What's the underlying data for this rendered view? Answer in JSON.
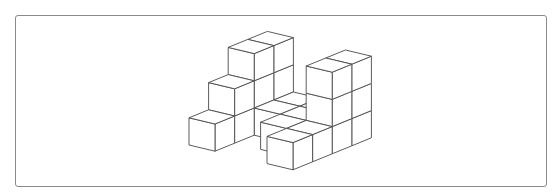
{
  "figure": {
    "cube_count": 24,
    "colors": {
      "edge": "#4a4a4a",
      "face": "#ffffff",
      "frame_border": "#8a8a8a"
    },
    "grid_axes": [
      "x (right)",
      "y (back)",
      "z (up)"
    ],
    "cubes": [
      [
        0,
        0,
        0
      ],
      [
        0,
        1,
        0
      ],
      [
        0,
        2,
        0
      ],
      [
        0,
        3,
        0
      ],
      [
        0,
        1,
        1
      ],
      [
        0,
        2,
        1
      ],
      [
        0,
        3,
        1
      ],
      [
        0,
        2,
        2
      ],
      [
        0,
        3,
        2
      ],
      [
        1,
        2,
        0
      ],
      [
        1,
        3,
        0
      ],
      [
        2,
        1,
        0
      ],
      [
        2,
        2,
        0
      ],
      [
        2,
        3,
        0
      ],
      [
        3,
        0,
        0
      ],
      [
        3,
        1,
        0
      ],
      [
        3,
        2,
        0
      ],
      [
        3,
        3,
        0
      ],
      [
        3,
        2,
        1
      ],
      [
        3,
        3,
        1
      ],
      [
        3,
        2,
        2
      ],
      [
        3,
        3,
        2
      ]
    ]
  }
}
